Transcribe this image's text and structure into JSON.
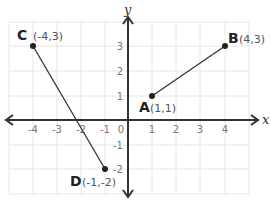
{
  "diagram": {
    "type": "coordinate-plane",
    "axes": {
      "x_label": "x",
      "y_label": "y",
      "x_ticks": [
        "-4",
        "-3",
        "-2",
        "-1",
        "0",
        "1",
        "2",
        "3",
        "4"
      ],
      "y_ticks": [
        "3",
        "2",
        "1",
        "-1",
        "-2"
      ]
    },
    "points": [
      {
        "name": "A",
        "coord": "(1,1)",
        "x": 1,
        "y": 1
      },
      {
        "name": "B",
        "coord": "(4,3)",
        "x": 4,
        "y": 3
      },
      {
        "name": "C",
        "coord": "(-4,3)",
        "x": -4,
        "y": 3
      },
      {
        "name": "D",
        "coord": "(-1,-2)",
        "x": -1,
        "y": -2
      }
    ],
    "segments": [
      {
        "from": "A",
        "to": "B"
      },
      {
        "from": "C",
        "to": "D"
      }
    ],
    "colors": {
      "grid": "#e6e6e6",
      "axis": "#333333",
      "segment": "#333333",
      "point": "#222222"
    }
  }
}
